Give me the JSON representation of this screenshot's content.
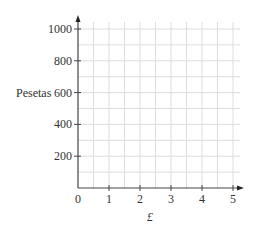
{
  "chart_data": {
    "type": "line",
    "title": "",
    "xlabel": "£",
    "ylabel": "Pesetas",
    "xlim": [
      0,
      5
    ],
    "ylim": [
      0,
      1000
    ],
    "x_ticks": [
      "0",
      "1",
      "2",
      "3",
      "4",
      "5"
    ],
    "y_ticks": [
      "200",
      "400",
      "600",
      "800",
      "1000"
    ],
    "grid": true,
    "grid_minor_x": 0.5,
    "grid_minor_y": 100,
    "series": [],
    "note": "Blank conversion graph grid with no plotted data"
  },
  "colors": {
    "axis": "#444444",
    "grid": "#dddddd",
    "text": "#333333"
  }
}
